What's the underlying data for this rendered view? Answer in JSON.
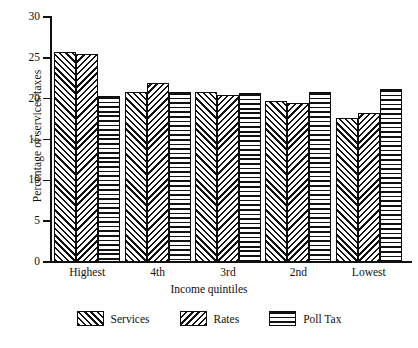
{
  "chart_data": {
    "type": "bar",
    "title": "",
    "xlabel": "Income quintiles",
    "ylabel": "Percentage of services/taxes",
    "categories": [
      "Highest",
      "4th",
      "3rd",
      "2nd",
      "Lowest"
    ],
    "series": [
      {
        "name": "Services",
        "pattern": "diagonal-forward",
        "values": [
          25.7,
          20.8,
          20.8,
          19.7,
          17.6
        ]
      },
      {
        "name": "Rates",
        "pattern": "diagonal-backward",
        "values": [
          25.5,
          21.9,
          20.4,
          19.5,
          18.2
        ]
      },
      {
        "name": "Poll Tax",
        "pattern": "horizontal-lines",
        "values": [
          20.3,
          20.8,
          20.7,
          20.8,
          21.2
        ]
      }
    ],
    "ylim": [
      0,
      30
    ],
    "yticks": [
      0,
      5,
      10,
      15,
      20,
      25,
      30
    ],
    "ytick_labels": [
      "0",
      "5",
      "10",
      "15",
      "20",
      "25",
      "30"
    ],
    "grid": false,
    "legend_position": "bottom",
    "legend_entries": [
      "Services",
      "Rates",
      "Poll Tax"
    ],
    "colors": {
      "ink": "#111111",
      "background": "#ffffff"
    }
  }
}
